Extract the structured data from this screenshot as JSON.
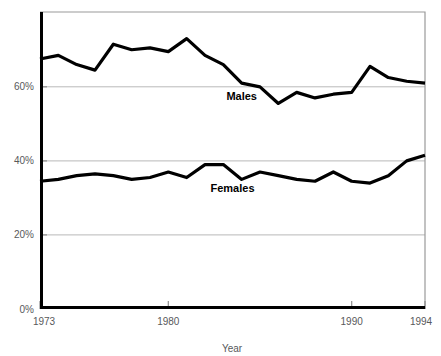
{
  "chart_data": {
    "type": "line",
    "title": "",
    "xlabel": "Year",
    "ylabel": "",
    "xlim": [
      1973,
      1994
    ],
    "ylim": [
      0,
      80
    ],
    "grid": true,
    "grid_axis": "y",
    "legend": "inline-labels",
    "y_ticks": [
      "0%",
      "20%",
      "40%",
      "60%"
    ],
    "y_tick_values": [
      0,
      20,
      40,
      60
    ],
    "x_ticks": [
      "1973",
      "1980",
      "1990",
      "1994"
    ],
    "x_tick_values": [
      1973,
      1980,
      1990,
      1994
    ],
    "x": [
      1973,
      1974,
      1975,
      1976,
      1977,
      1978,
      1979,
      1980,
      1981,
      1982,
      1983,
      1984,
      1985,
      1986,
      1987,
      1988,
      1989,
      1990,
      1991,
      1992,
      1993,
      1994
    ],
    "series": [
      {
        "name": "Males",
        "label": "Males",
        "label_x": 1984,
        "label_y": 56.5,
        "values": [
          67.5,
          68.5,
          66.0,
          64.5,
          71.5,
          70.0,
          70.5,
          69.5,
          73.0,
          68.5,
          66.0,
          61.0,
          60.0,
          55.5,
          58.5,
          57.0,
          58.0,
          58.5,
          65.5,
          62.5,
          61.5,
          61.0
        ]
      },
      {
        "name": "Females",
        "label": "Females",
        "label_x": 1983.5,
        "label_y": 31.5,
        "values": [
          34.5,
          35.0,
          36.0,
          36.5,
          36.0,
          35.0,
          35.5,
          37.0,
          35.5,
          39.0,
          39.0,
          35.0,
          37.0,
          36.0,
          35.0,
          34.5,
          37.0,
          34.5,
          34.0,
          36.0,
          40.0,
          41.5
        ]
      }
    ],
    "annotations": []
  },
  "geometry": {
    "plot_left": 40,
    "plot_right": 425,
    "plot_top": 12,
    "plot_bottom": 309,
    "y_value_at_top": 80.2
  }
}
